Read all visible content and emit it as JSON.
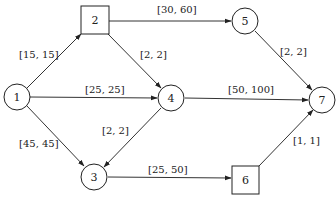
{
  "diagram": {
    "type": "directed-graph",
    "nodes": [
      {
        "id": "1",
        "label": "1",
        "shape": "circle",
        "x": 17,
        "y": 97
      },
      {
        "id": "2",
        "label": "2",
        "shape": "square",
        "x": 95,
        "y": 20
      },
      {
        "id": "3",
        "label": "3",
        "shape": "circle",
        "x": 94,
        "y": 177
      },
      {
        "id": "4",
        "label": "4",
        "shape": "circle",
        "x": 171,
        "y": 98
      },
      {
        "id": "5",
        "label": "5",
        "shape": "circle",
        "x": 245,
        "y": 21
      },
      {
        "id": "6",
        "label": "6",
        "shape": "square",
        "x": 245,
        "y": 180
      },
      {
        "id": "7",
        "label": "7",
        "shape": "circle",
        "x": 322,
        "y": 100
      }
    ],
    "edges": [
      {
        "from": "1",
        "to": "2",
        "label": "[15, 15]"
      },
      {
        "from": "1",
        "to": "4",
        "label": "[25, 25]"
      },
      {
        "from": "1",
        "to": "3",
        "label": "[45, 45]"
      },
      {
        "from": "2",
        "to": "5",
        "label": "[30, 60]"
      },
      {
        "from": "2",
        "to": "4",
        "label": "[2, 2]"
      },
      {
        "from": "4",
        "to": "3",
        "label": "[2, 2]"
      },
      {
        "from": "4",
        "to": "7",
        "label": "[50, 100]"
      },
      {
        "from": "5",
        "to": "7",
        "label": "[2, 2]"
      },
      {
        "from": "3",
        "to": "6",
        "label": "[25, 50]"
      },
      {
        "from": "6",
        "to": "7",
        "label": "[1, 1]"
      }
    ]
  }
}
